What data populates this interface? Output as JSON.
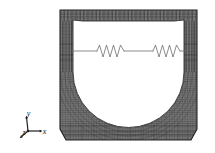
{
  "figure": {
    "background_color": "#ffffff",
    "mesh_color": "#4a4a4a",
    "mesh_fill": "#6f6f6f",
    "outline_color": "#2b2b2b",
    "spring_color": "#7d7d7d",
    "width_px": 215,
    "height_px": 153
  },
  "structure": {
    "name": "u-shaped-mesh-body",
    "description": "Trapezoidal body with U-shaped internal cavity, meshed with quadrilateral elements",
    "outer_left_x": 60,
    "outer_right_x": 197,
    "outer_top_y": 10,
    "outer_bottom_y": 140,
    "wall_thickness": 13,
    "top_beam_height": 10,
    "cavity_top_y": 20,
    "cavity_arc_radius": 52
  },
  "springs": {
    "label": "spring-elements",
    "count": 2,
    "connector_y": 51,
    "left_anchor_x": 72,
    "right_anchor_x": 186,
    "elements": [
      {
        "name": "spring-1",
        "start_x": 97,
        "end_x": 124,
        "coils": 4
      },
      {
        "name": "spring-2",
        "start_x": 153,
        "end_x": 180,
        "coils": 4
      }
    ]
  },
  "axis_triad": {
    "name": "coordinate-axis-triad",
    "origin_x": 28,
    "origin_y": 131,
    "x_label": "x",
    "y_label": "y",
    "z_label": "z",
    "x_end_x": 42,
    "x_end_y": 131,
    "y_end_x": 26,
    "y_end_y": 116,
    "z_end_x": 20,
    "z_end_y": 138
  }
}
